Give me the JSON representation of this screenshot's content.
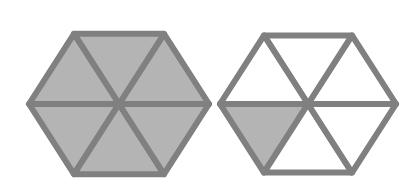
{
  "figure": {
    "colors": {
      "stroke": "#808080",
      "shaded_fill": "#b4b4b4",
      "unshaded_fill": "#ffffff",
      "background": "#ffffff"
    },
    "hexagons": [
      {
        "id": "left",
        "center": [
          119,
          104
        ],
        "radius": 90,
        "shaded_triangles": 6,
        "total_triangles": 6,
        "shaded": [
          true,
          true,
          true,
          true,
          true,
          true
        ]
      },
      {
        "id": "right",
        "center": [
          308,
          104
        ],
        "radius": 88,
        "shaded_triangles": 1,
        "total_triangles": 6,
        "shaded": [
          false,
          false,
          false,
          true,
          false,
          false
        ]
      }
    ]
  }
}
